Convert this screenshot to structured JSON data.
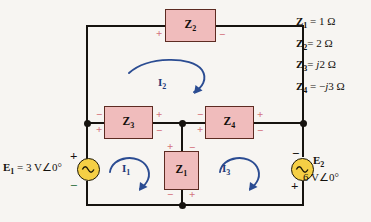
{
  "diagram": {
    "colors": {
      "background": "#f7f5f2",
      "wire": "#16130f",
      "impedance_fill": "#f0bcbc",
      "impedance_border": "#5d2b22",
      "source_fill": "#f5cf45",
      "polarity": "#d4727d",
      "current_arrow": "#1e3a78"
    }
  },
  "impedances": [
    {
      "id": "Z1",
      "symbol": "Z",
      "sub": "1",
      "orientation": "vertical",
      "polarity": {
        "top_left": "+",
        "top_right": "−",
        "bottom_left": "−",
        "bottom_right": "+"
      }
    },
    {
      "id": "Z2",
      "symbol": "Z",
      "sub": "2",
      "orientation": "horizontal",
      "polarity": {
        "left": "+",
        "right": "−"
      }
    },
    {
      "id": "Z3",
      "symbol": "Z",
      "sub": "3",
      "orientation": "horizontal",
      "polarity": {
        "left_upper": "−",
        "left_lower": "+",
        "right_upper": "+",
        "right_lower": "−"
      }
    },
    {
      "id": "Z4",
      "symbol": "Z",
      "sub": "4",
      "orientation": "horizontal",
      "polarity": {
        "left_upper": "−",
        "left_lower": "+",
        "right_upper": "+",
        "right_lower": "−"
      }
    }
  ],
  "sources": [
    {
      "id": "E1",
      "symbol": "E",
      "sub": "1",
      "label": "= 3 V∠0°",
      "full_label": "E₁ = 3 V∠0°",
      "polarity_top": "+",
      "polarity_bottom": "−",
      "type": "ac-source"
    },
    {
      "id": "E2",
      "symbol": "E",
      "sub": "2",
      "label": "6 V∠0°",
      "full_label": "E₂ 6 V∠0°",
      "polarity_top": "−",
      "polarity_bottom": "+",
      "type": "ac-source"
    }
  ],
  "currents": [
    {
      "id": "I1",
      "symbol": "I",
      "sub": "1",
      "direction": "clockwise",
      "mesh": "left-lower"
    },
    {
      "id": "I2",
      "symbol": "I",
      "sub": "2",
      "direction": "clockwise",
      "mesh": "upper"
    },
    {
      "id": "I3",
      "symbol": "I",
      "sub": "3",
      "direction": "clockwise",
      "mesh": "right-lower"
    }
  ],
  "legend": {
    "rows": [
      {
        "symbol": "Z",
        "sub": "1",
        "eq": "=",
        "value": "1",
        "imag": "",
        "unit": "Ω",
        "text": "Z₁ = 1 Ω"
      },
      {
        "symbol": "Z",
        "sub": "2",
        "eq": "=",
        "value": "2",
        "imag": "",
        "unit": "Ω",
        "text": "Z₂ = 2 Ω"
      },
      {
        "symbol": "Z",
        "sub": "3",
        "eq": "=",
        "value": "2",
        "imag": "j",
        "unit": "Ω",
        "text": "Z₃ = j2 Ω"
      },
      {
        "symbol": "Z",
        "sub": "4",
        "eq": "=",
        "value": "3",
        "imag": "−j",
        "unit": "Ω",
        "text": "Z₄ = −j3 Ω"
      }
    ]
  },
  "polarity_glyphs": {
    "plus": "+",
    "minus": "−"
  }
}
